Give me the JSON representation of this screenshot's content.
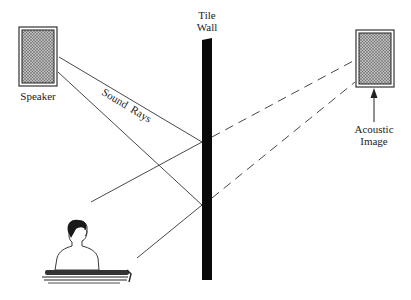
{
  "labels": {
    "speaker": "Speaker",
    "tile_wall_line1": "Tile",
    "tile_wall_line2": "Wall",
    "sound_rays": "Sound  Rays",
    "acoustic_image_line1": "Acoustic",
    "acoustic_image_line2": "Image"
  },
  "colors": {
    "ink": "#222222",
    "wall": "#0a0a0a",
    "speaker_fill": "#9a9a9a"
  }
}
